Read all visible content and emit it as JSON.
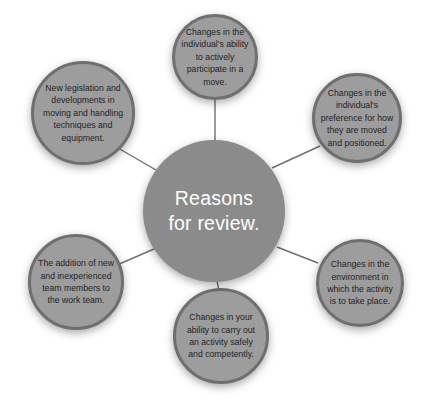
{
  "diagram": {
    "type": "hub-and-spoke",
    "title": "Reasons for review.",
    "background_color": "#ffffff",
    "center": {
      "label": "Reasons for review.",
      "fill_color": "#8b8b8b",
      "text_color": "#ffffff",
      "cx": 214,
      "cy": 211,
      "r": 71
    },
    "satellite_style": {
      "fill_color": "#9d9d9d",
      "ring_color": "#6f6f6f",
      "text_color": "#1f1f1f"
    },
    "connector_color": "#6f6f6f",
    "nodes": [
      {
        "id": "node-participation",
        "label": "Changes in the individual's ability to actively participate in a move.",
        "cx": 215,
        "cy": 57,
        "r": 43,
        "position": "top"
      },
      {
        "id": "node-preference",
        "label": "Changes in the individual's preference for how they are moved and positioned.",
        "cx": 357,
        "cy": 118,
        "r": 45,
        "position": "top-right"
      },
      {
        "id": "node-environment",
        "label": "Changes in the environment in which the activity is to take place.",
        "cx": 360,
        "cy": 283,
        "r": 44,
        "position": "bottom-right"
      },
      {
        "id": "node-ability",
        "label": "Changes in your ability to carry out an activity safely and competently.",
        "cx": 221,
        "cy": 336,
        "r": 48,
        "position": "bottom"
      },
      {
        "id": "node-new-members",
        "label": "The addition of new and inexperienced team members to the work team.",
        "cx": 76,
        "cy": 282,
        "r": 48,
        "position": "bottom-left"
      },
      {
        "id": "node-legislation",
        "label": "New legislation and developments in moving and handling techniques and equipment.",
        "cx": 83,
        "cy": 113,
        "r": 52,
        "position": "top-left"
      }
    ],
    "connectors": [
      {
        "id": "connector-participation",
        "x1": 215,
        "y1": 140,
        "x2": 215,
        "y2": 100
      },
      {
        "id": "connector-preference",
        "x1": 272,
        "y1": 168,
        "x2": 320,
        "y2": 146
      },
      {
        "id": "connector-environment",
        "x1": 277,
        "y1": 247,
        "x2": 318,
        "y2": 263
      },
      {
        "id": "connector-ability",
        "x1": 217,
        "y1": 282,
        "x2": 219,
        "y2": 289
      },
      {
        "id": "connector-new-members",
        "x1": 154,
        "y1": 249,
        "x2": 117,
        "y2": 265
      },
      {
        "id": "connector-legislation",
        "x1": 156,
        "y1": 170,
        "x2": 118,
        "y2": 148
      }
    ]
  }
}
